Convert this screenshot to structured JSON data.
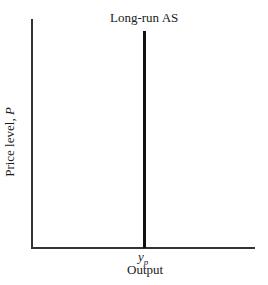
{
  "diagram": {
    "curve_label": "Long-run AS",
    "y_axis_label": "Price level, ",
    "y_axis_var": "P",
    "x_axis_label": "Output",
    "x_tick_var": "y",
    "x_tick_sub": "p"
  }
}
